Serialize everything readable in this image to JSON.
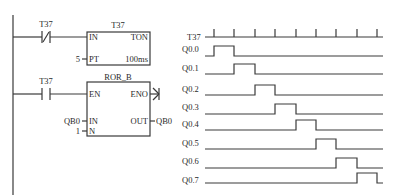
{
  "ladder": {
    "rung1": {
      "contact": {
        "label": "T37",
        "type": "normally-closed"
      },
      "block": {
        "title": "T37",
        "type": "TON",
        "in_label": "IN",
        "pt_label": "PT",
        "pt_value": "5",
        "timebase": "100ms"
      }
    },
    "rung2": {
      "contact": {
        "label": "T37",
        "type": "normally-open"
      },
      "block": {
        "title": "ROR_B",
        "en_label": "EN",
        "eno_label": "ENO",
        "in_label": "IN",
        "in_value": "QB0",
        "out_label": "OUT",
        "out_value": "QB0",
        "n_label": "N",
        "n_value": "1"
      }
    }
  },
  "timing": {
    "clock_label": "T37",
    "signals": [
      "Q0.0",
      "Q0.1",
      "Q0.2",
      "Q0.3",
      "Q0.4",
      "Q0.5",
      "Q0.6",
      "Q0.7"
    ],
    "tick_count": 9
  }
}
